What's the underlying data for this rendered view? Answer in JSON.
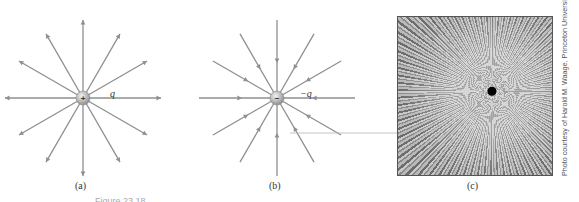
{
  "figure": {
    "panels": [
      {
        "id": "a",
        "label": "(a)",
        "charge_label": "q",
        "charge_sign": "+",
        "field_direction": "outward",
        "line_count": 12
      },
      {
        "id": "b",
        "label": "(b)",
        "charge_label": "−q",
        "charge_sign": "−",
        "field_direction": "inward",
        "line_count": 12
      },
      {
        "id": "c",
        "label": "(c)",
        "description": "photograph of field-line pattern around a charged object"
      }
    ],
    "photo_credit": "Photo courtesy of Harold M. Waage, Princeton University",
    "caption_partial": "Figure 23.18",
    "colors": {
      "line": "#8f8f8f",
      "charge": "#bdbdbd",
      "text": "#333333"
    }
  }
}
